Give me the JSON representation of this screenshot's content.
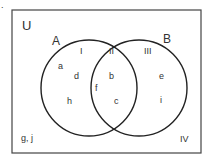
{
  "diagram": {
    "type": "venn",
    "corner_mark": ".",
    "universe_label": "U",
    "sets": [
      {
        "name": "A",
        "label": "A"
      },
      {
        "name": "B",
        "label": "B"
      }
    ],
    "regions": {
      "I": {
        "label": "I",
        "elements": [
          "a",
          "d",
          "h"
        ]
      },
      "II": {
        "label": "II",
        "elements": [
          "b",
          "f",
          "c"
        ]
      },
      "III": {
        "label": "III",
        "elements": [
          "e",
          "i"
        ]
      },
      "IV": {
        "label": "IV",
        "elements": [
          "g, j"
        ]
      }
    },
    "elements": {
      "a": "a",
      "d": "d",
      "h": "h",
      "b": "b",
      "f": "f",
      "c": "c",
      "e": "e",
      "i": "i",
      "outside": "g, j"
    },
    "colors": {
      "stroke": "#222222",
      "text": "#333333",
      "background": "#ffffff"
    }
  }
}
